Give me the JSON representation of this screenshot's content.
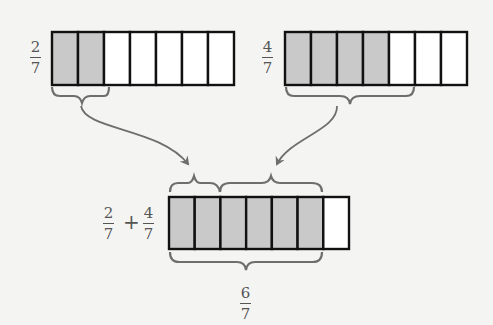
{
  "diagram": {
    "title": "",
    "colors": {
      "background": "#f4f4f2",
      "shaded_cell": "#c9c9c9",
      "empty_cell": "#ffffff",
      "cell_border": "#111111",
      "brace_and_arrow": "#6e6e6e",
      "label_text": "#555555"
    },
    "bars": [
      {
        "id": "top-left",
        "label": {
          "numerator": "2",
          "denominator": "7"
        },
        "total_parts": 7,
        "shaded_parts": 2
      },
      {
        "id": "top-right",
        "label": {
          "numerator": "4",
          "denominator": "7"
        },
        "total_parts": 7,
        "shaded_parts": 4
      },
      {
        "id": "bottom-sum",
        "label": {
          "left": {
            "numerator": "2",
            "denominator": "7"
          },
          "operator": "+",
          "right": {
            "numerator": "4",
            "denominator": "7"
          }
        },
        "total_parts": 7,
        "shaded_parts": 6
      }
    ],
    "braces": [
      {
        "under": "top-left",
        "spans_parts": 2
      },
      {
        "under": "top-right",
        "spans_parts": 4
      },
      {
        "over": "bottom-sum",
        "spans_parts": 2
      },
      {
        "over": "bottom-sum",
        "spans_parts": 4,
        "starting_part": 3
      },
      {
        "under": "bottom-sum",
        "spans_parts": 6
      }
    ],
    "arrows": [
      {
        "from": "top-left brace",
        "to": "bottom-sum first brace"
      },
      {
        "from": "top-right brace",
        "to": "bottom-sum second brace"
      }
    ],
    "result": {
      "numerator": "6",
      "denominator": "7"
    }
  }
}
